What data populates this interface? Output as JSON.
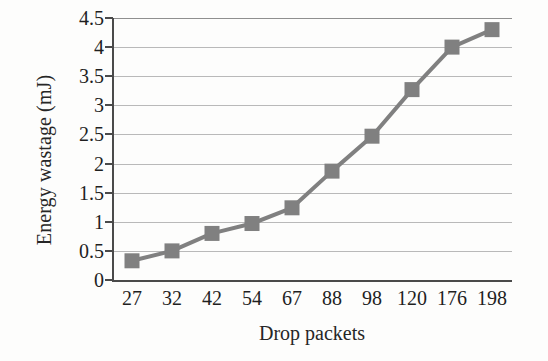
{
  "chart_data": {
    "type": "line",
    "title": "",
    "xlabel": "Drop packets",
    "ylabel": "Energy wastage (mJ)",
    "categories": [
      "27",
      "32",
      "42",
      "54",
      "67",
      "88",
      "98",
      "120",
      "176",
      "198"
    ],
    "values": [
      0.33,
      0.5,
      0.8,
      0.97,
      1.24,
      1.87,
      2.47,
      3.27,
      4.0,
      4.3
    ],
    "ylim": [
      0,
      4.5
    ],
    "ytick_labels": [
      "0",
      "0.5",
      "1",
      "1.5",
      "2",
      "2.5",
      "3",
      "3.5",
      "4",
      "4.5"
    ],
    "ytick_values": [
      0,
      0.5,
      1,
      1.5,
      2,
      2.5,
      3,
      3.5,
      4,
      4.5
    ],
    "grid": "horizontal",
    "legend": "none",
    "marker": "square",
    "series_color": "#808080",
    "grid_color": "#b9b9b9",
    "axis_color": "#4a4a4a"
  }
}
